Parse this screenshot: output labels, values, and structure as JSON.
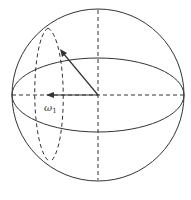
{
  "diagram": {
    "type": "sphere-with-rotation-vectors",
    "label_omega": "ω",
    "label_omega_sub": "1",
    "caption": "",
    "colors": {
      "stroke": "#333333",
      "caption": "#cfcfcf",
      "background": "#ffffff"
    }
  }
}
